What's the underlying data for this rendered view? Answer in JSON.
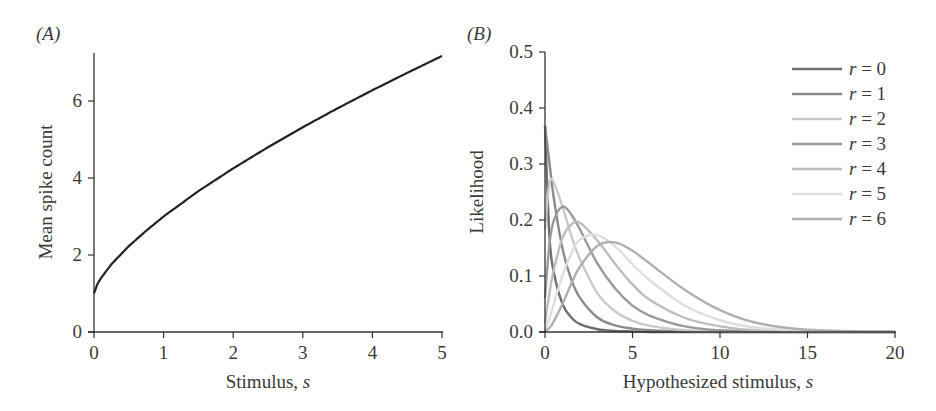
{
  "panels": {
    "a": {
      "label": "(A)"
    },
    "b": {
      "label": "(B)"
    }
  },
  "chart_data": [
    {
      "panel": "(A)",
      "type": "line",
      "title": "",
      "xlabel": "Stimulus, s",
      "ylabel": "Mean spike count",
      "xlim": [
        0,
        5
      ],
      "ylim": [
        0,
        7.2
      ],
      "xticks": [
        0,
        1,
        2,
        3,
        4,
        5
      ],
      "yticks": [
        0,
        2,
        4,
        6
      ],
      "grid": false,
      "legend": null,
      "series": [
        {
          "name": "Mean spike count",
          "color": "#222222",
          "x": [
            0,
            0.05,
            0.1,
            0.25,
            0.5,
            0.75,
            1,
            1.5,
            2,
            2.5,
            3,
            3.5,
            4,
            4.5,
            5
          ],
          "y": [
            1.0,
            1.25,
            1.4,
            1.76,
            2.23,
            2.63,
            3.0,
            3.66,
            4.25,
            4.8,
            5.32,
            5.81,
            6.28,
            6.73,
            7.17
          ]
        }
      ]
    },
    {
      "panel": "(B)",
      "type": "line",
      "title": "",
      "xlabel": "Hypothesized stimulus, s",
      "ylabel": "Likelihood",
      "xlim": [
        0,
        20
      ],
      "ylim": [
        0,
        0.5
      ],
      "xticks": [
        0,
        5,
        10,
        15,
        20
      ],
      "yticks": [
        "0.0",
        "0.1",
        "0.2",
        "0.3",
        "0.4",
        "0.5"
      ],
      "grid": false,
      "legend": {
        "position": "upper right"
      },
      "x": [
        0,
        0.25,
        0.5,
        1,
        1.5,
        2,
        3,
        4,
        5,
        6,
        8,
        10,
        12,
        15,
        20
      ],
      "series": [
        {
          "name": "r = 0",
          "color": "#6e6e6e",
          "values": [
            0.368,
            0.172,
            0.107,
            0.05,
            0.026,
            0.014,
            0.005,
            0.002,
            0.001,
            0.0,
            0,
            0,
            0,
            0,
            0
          ]
        },
        {
          "name": "r = 1",
          "color": "#8a8a8a",
          "values": [
            0.368,
            0.303,
            0.24,
            0.149,
            0.094,
            0.061,
            0.026,
            0.012,
            0.006,
            0.003,
            0.001,
            0,
            0,
            0,
            0
          ]
        },
        {
          "name": "r = 2",
          "color": "#c9c9c9",
          "values": [
            0.184,
            0.266,
            0.267,
            0.224,
            0.172,
            0.13,
            0.069,
            0.037,
            0.02,
            0.011,
            0.003,
            0.001,
            0,
            0,
            0
          ]
        },
        {
          "name": "r = 3",
          "color": "#9a9a9a",
          "values": [
            0.061,
            0.156,
            0.199,
            0.224,
            0.21,
            0.183,
            0.122,
            0.078,
            0.047,
            0.029,
            0.01,
            0.003,
            0.001,
            0,
            0
          ]
        },
        {
          "name": "r = 4",
          "color": "#bdbdbd",
          "values": [
            0.015,
            0.069,
            0.111,
            0.168,
            0.192,
            0.195,
            0.163,
            0.122,
            0.085,
            0.057,
            0.025,
            0.01,
            0.003,
            0.001,
            0
          ]
        },
        {
          "name": "r = 5",
          "color": "#dedede",
          "values": [
            0.003,
            0.024,
            0.05,
            0.101,
            0.14,
            0.165,
            0.173,
            0.153,
            0.121,
            0.092,
            0.047,
            0.021,
            0.008,
            0.002,
            0.0
          ]
        },
        {
          "name": "r = 6",
          "color": "#b0b0b0",
          "values": [
            0.001,
            0.007,
            0.019,
            0.05,
            0.086,
            0.117,
            0.154,
            0.16,
            0.145,
            0.122,
            0.075,
            0.039,
            0.017,
            0.004,
            0.0
          ]
        }
      ]
    }
  ],
  "legend": [
    {
      "label": "r = 0",
      "color": "#6e6e6e"
    },
    {
      "label": "r = 1",
      "color": "#8a8a8a"
    },
    {
      "label": "r = 2",
      "color": "#c9c9c9"
    },
    {
      "label": "r = 3",
      "color": "#9a9a9a"
    },
    {
      "label": "r = 4",
      "color": "#bdbdbd"
    },
    {
      "label": "r = 5",
      "color": "#dedede"
    },
    {
      "label": "r = 6",
      "color": "#b0b0b0"
    }
  ],
  "axes": {
    "a": {
      "xlabel": "Stimulus, s",
      "ylabel": "Mean spike count",
      "xticks": [
        "0",
        "1",
        "2",
        "3",
        "4",
        "5"
      ],
      "yticks": [
        "0",
        "2",
        "4",
        "6"
      ]
    },
    "b": {
      "xlabel": "Hypothesized stimulus, s",
      "ylabel": "Likelihood",
      "xticks": [
        "0",
        "5",
        "10",
        "15",
        "20"
      ],
      "yticks": [
        "0.0",
        "0.1",
        "0.2",
        "0.3",
        "0.4",
        "0.5"
      ]
    }
  }
}
